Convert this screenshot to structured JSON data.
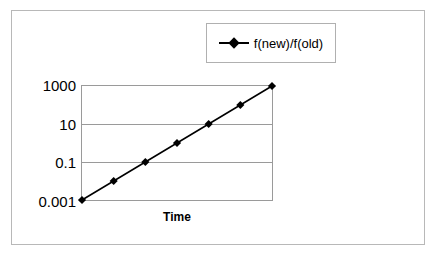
{
  "chart_data": {
    "type": "line",
    "title": "",
    "subtitle": "",
    "xlabel": "Time",
    "ylabel": "",
    "yscale": "log",
    "ylim": [
      0.001,
      1000
    ],
    "ytick_labels": [
      "1000",
      "10",
      "0.1",
      "0.001"
    ],
    "ytick_values": [
      1000,
      10,
      0.1,
      0.001
    ],
    "xtick_labels": [],
    "grid": "horizontal",
    "legend_position": "top-right",
    "series": [
      {
        "name": "f(new)/f(old)",
        "marker": "diamond",
        "color": "#000000",
        "x": [
          1,
          2,
          3,
          4,
          5,
          6,
          7
        ],
        "values": [
          0.001,
          0.01,
          0.1,
          1,
          10,
          100,
          1000
        ]
      }
    ]
  },
  "legend": {
    "entries": [
      {
        "label": "f(new)/f(old)"
      }
    ]
  },
  "axes": {
    "x_title": "Time",
    "y_ticks": [
      {
        "label": "1000"
      },
      {
        "label": "10"
      },
      {
        "label": "0.1"
      },
      {
        "label": "0.001"
      }
    ]
  }
}
